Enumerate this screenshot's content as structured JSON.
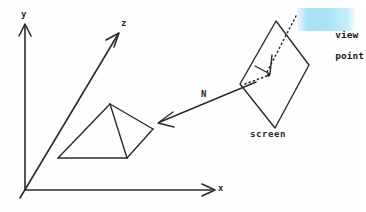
{
  "figure": {
    "background_color": "#fefefe",
    "ink_color": "#2b2b2b",
    "highlight_color": "#a5e1f8"
  },
  "axes": {
    "y_label": "y",
    "z_label": "z",
    "x_label": "x",
    "origin": {
      "x": 25,
      "y": 190
    }
  },
  "labels": {
    "normal_vector": "N",
    "screen": "screen",
    "viewpoint_line1": "view",
    "viewpoint_line2": "point"
  },
  "objects": {
    "pyramid_name": "pyramid-object",
    "screen_name": "screen-plane",
    "viewpoint_marker": "view-point-dot"
  }
}
